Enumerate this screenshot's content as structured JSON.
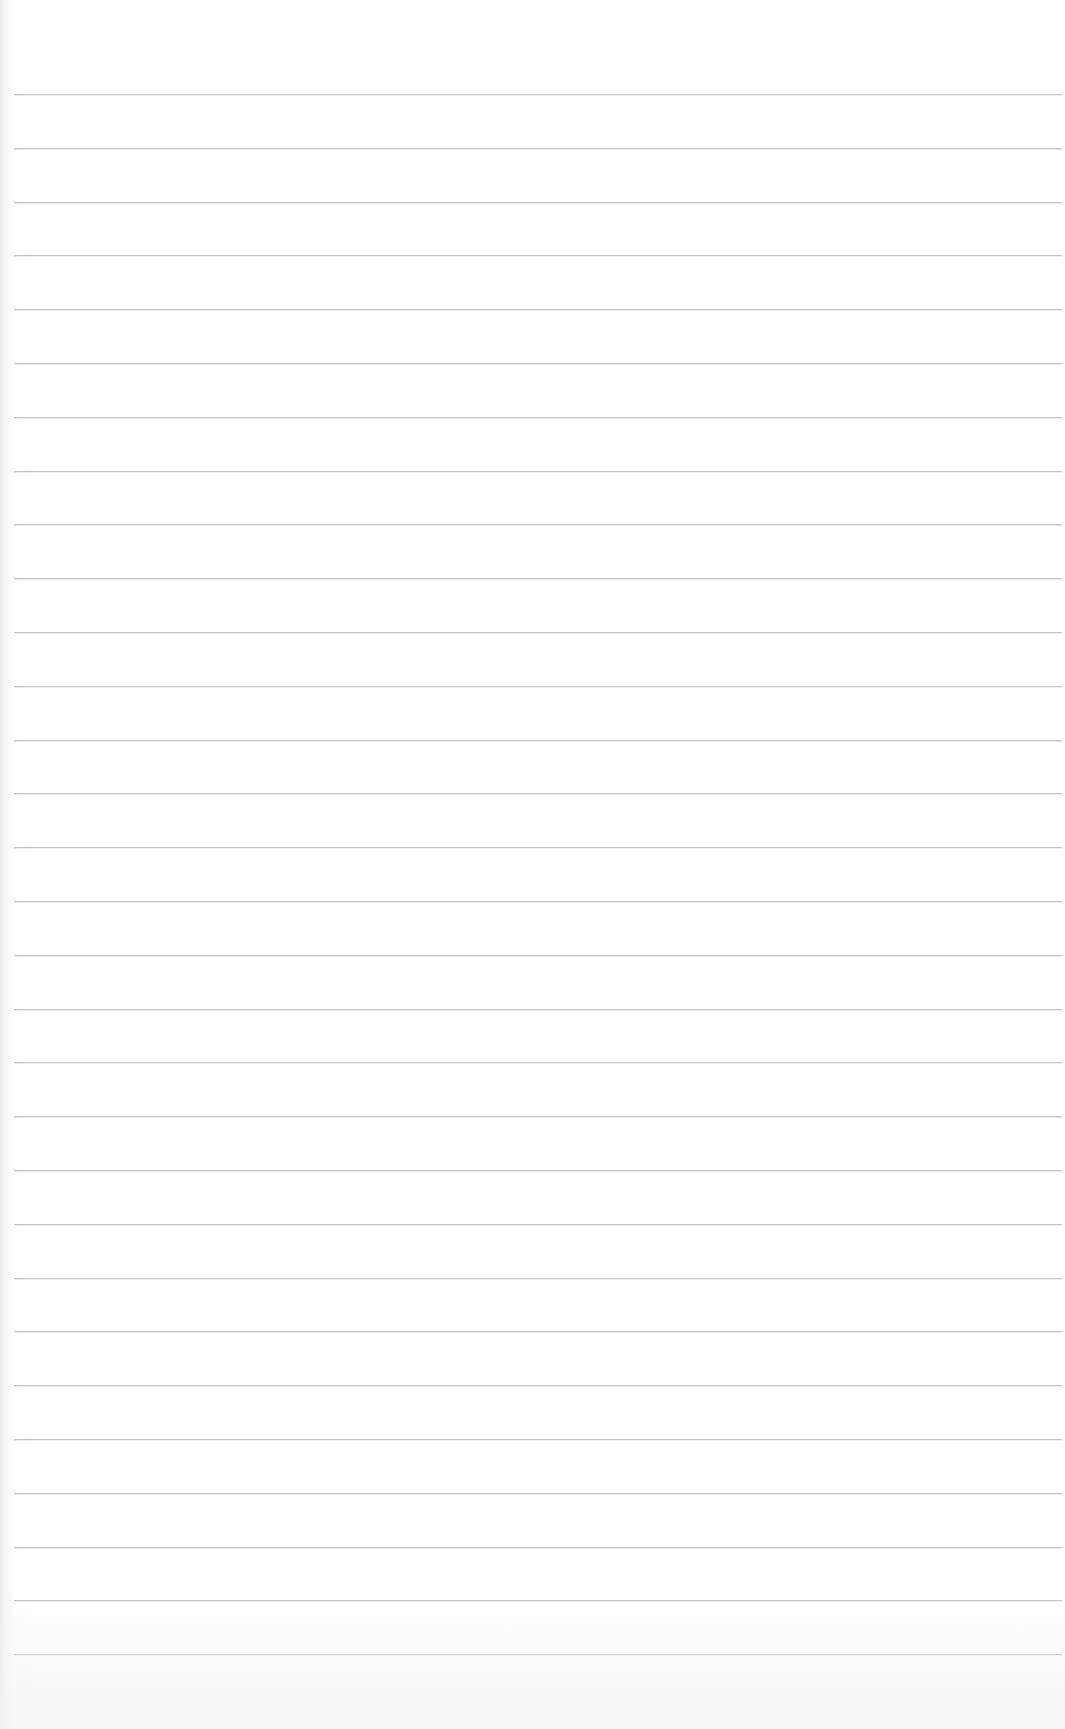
{
  "page": {
    "type": "lined-paper",
    "background_color": "#ffffff",
    "line_color": "#b9b9b9",
    "line_count": 30,
    "first_line_y": 94,
    "line_spacing": 53.8,
    "line_left": 14,
    "line_width": 1048
  }
}
